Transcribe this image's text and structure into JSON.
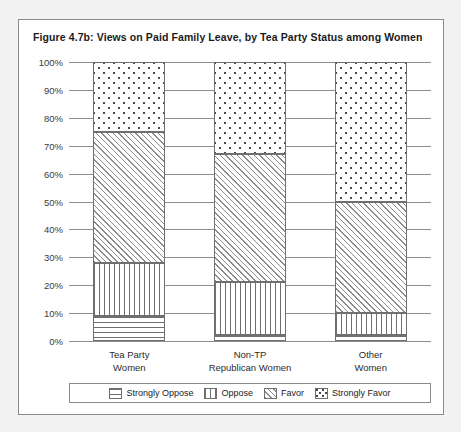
{
  "figure": {
    "title": "Figure 4.7b: Views on Paid Family Leave, by Tea Party Status among Women"
  },
  "chart_data": {
    "type": "bar",
    "stacked": true,
    "stacked_mode": "percent",
    "title": "Figure 4.7b: Views on Paid Family Leave, by Tea Party Status among Women",
    "xlabel": "",
    "ylabel": "",
    "ylim": [
      0,
      100
    ],
    "yticks": [
      "0%",
      "10%",
      "20%",
      "30%",
      "40%",
      "50%",
      "60%",
      "70%",
      "80%",
      "90%",
      "100%"
    ],
    "ytick_values": [
      0,
      10,
      20,
      30,
      40,
      50,
      60,
      70,
      80,
      90,
      100
    ],
    "grid": true,
    "legend_position": "bottom",
    "categories": [
      "Tea Party Women",
      "Non-TP Republican Women",
      "Other Women"
    ],
    "category_lines": [
      [
        "Tea Party",
        "Women"
      ],
      [
        "Non-TP",
        "Republican Women"
      ],
      [
        "Other",
        "Women"
      ]
    ],
    "series": [
      {
        "name": "Strongly Oppose",
        "pattern": "horizontal-lines",
        "values": [
          9,
          2,
          2
        ]
      },
      {
        "name": "Oppose",
        "pattern": "vertical-lines",
        "values": [
          19,
          19,
          8
        ]
      },
      {
        "name": "Favor",
        "pattern": "diagonal-hatch",
        "values": [
          47,
          46,
          40
        ]
      },
      {
        "name": "Strongly Favor",
        "pattern": "dots",
        "values": [
          25,
          33,
          50
        ]
      }
    ],
    "cumulative_tops": {
      "Tea Party Women": [
        9,
        28,
        75,
        100
      ],
      "Non-TP Republican Women": [
        2,
        21,
        67,
        100
      ],
      "Other Women": [
        2,
        10,
        50,
        100
      ]
    }
  },
  "legend": {
    "items": [
      {
        "label": "Strongly Oppose",
        "pattern": "horizontal-lines"
      },
      {
        "label": "Oppose",
        "pattern": "vertical-lines"
      },
      {
        "label": "Favor",
        "pattern": "diagonal-hatch"
      },
      {
        "label": "Strongly Favor",
        "pattern": "dots"
      }
    ]
  },
  "colors": {
    "panel_border": "#8a8a8a",
    "gridline": "#8d8d8d",
    "segment_outline": "#6f6f6f",
    "page_background": "#f2f2f2",
    "panel_background": "#ffffff",
    "text": "#222222"
  }
}
